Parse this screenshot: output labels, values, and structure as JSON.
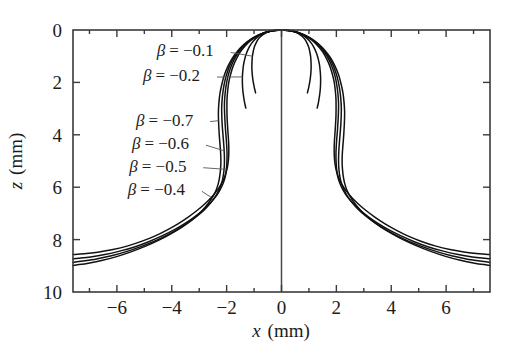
{
  "chart_data": {
    "type": "line",
    "title": "",
    "xlabel": "x (mm)",
    "ylabel": "z (mm)",
    "xlabel_var": "x",
    "xlabel_unit": "(mm)",
    "ylabel_var": "z",
    "ylabel_unit": "(mm)",
    "xlim": [
      -7.6,
      7.6
    ],
    "ylim": [
      0,
      10
    ],
    "y_inverted": true,
    "grid": false,
    "legend_position": "inline-annotations",
    "xticks": [
      -6,
      -4,
      -2,
      0,
      2,
      4,
      6
    ],
    "xtick_labels": [
      "−6",
      "−4",
      "−2",
      "0",
      "2",
      "4",
      "6"
    ],
    "yticks": [
      0,
      2,
      4,
      6,
      8,
      10
    ],
    "ytick_labels": [
      "0",
      "2",
      "4",
      "6",
      "8",
      "10"
    ],
    "xminorticks": [
      -7,
      -5,
      -3,
      -1,
      1,
      3,
      5,
      7
    ],
    "symmetry_axis_x": 0,
    "annotations": [
      {
        "text": "β = −0.1",
        "beta": -0.1,
        "label_x": -4.55,
        "label_z": 0.78
      },
      {
        "text": "β = −0.2",
        "beta": -0.2,
        "label_x": -5.05,
        "label_z": 1.72
      },
      {
        "text": "β = −0.7",
        "beta": -0.7,
        "label_x": -5.3,
        "label_z": 3.42
      },
      {
        "text": "β = −0.6",
        "beta": -0.6,
        "label_x": -5.45,
        "label_z": 4.32
      },
      {
        "text": "β = −0.5",
        "beta": -0.5,
        "label_x": -5.55,
        "label_z": 5.18
      },
      {
        "text": "β = −0.4",
        "beta": -0.4,
        "label_x": -5.6,
        "label_z": 6.08
      }
    ],
    "series": [
      {
        "name": "β = −0.1",
        "beta": -0.1,
        "half_profile": [
          [
            0.0,
            0.0
          ],
          [
            0.12,
            0.005
          ],
          [
            0.26,
            0.02
          ],
          [
            0.4,
            0.05
          ],
          [
            0.54,
            0.1
          ],
          [
            0.66,
            0.17
          ],
          [
            0.77,
            0.26
          ],
          [
            0.86,
            0.37
          ],
          [
            0.93,
            0.5
          ],
          [
            0.99,
            0.65
          ],
          [
            1.03,
            0.82
          ],
          [
            1.06,
            1.0
          ],
          [
            1.075,
            1.19
          ],
          [
            1.08,
            1.38
          ],
          [
            1.075,
            1.57
          ],
          [
            1.06,
            1.75
          ],
          [
            1.04,
            1.92
          ],
          [
            1.015,
            2.07
          ],
          [
            0.99,
            2.2
          ],
          [
            0.965,
            2.31
          ],
          [
            0.945,
            2.4
          ]
        ]
      },
      {
        "name": "β = −0.2",
        "beta": -0.2,
        "half_profile": [
          [
            0.0,
            0.0
          ],
          [
            0.15,
            0.007
          ],
          [
            0.32,
            0.03
          ],
          [
            0.5,
            0.07
          ],
          [
            0.68,
            0.14
          ],
          [
            0.84,
            0.24
          ],
          [
            0.98,
            0.37
          ],
          [
            1.1,
            0.52
          ],
          [
            1.2,
            0.7
          ],
          [
            1.28,
            0.9
          ],
          [
            1.34,
            1.11
          ],
          [
            1.385,
            1.33
          ],
          [
            1.41,
            1.56
          ],
          [
            1.425,
            1.79
          ],
          [
            1.425,
            2.02
          ],
          [
            1.415,
            2.24
          ],
          [
            1.395,
            2.44
          ],
          [
            1.37,
            2.62
          ],
          [
            1.345,
            2.77
          ],
          [
            1.32,
            2.89
          ],
          [
            1.3,
            2.98
          ]
        ]
      },
      {
        "name": "β = −0.4",
        "beta": -0.4,
        "half_profile": [
          [
            0.0,
            0.0
          ],
          [
            0.2,
            0.01
          ],
          [
            0.42,
            0.05
          ],
          [
            0.66,
            0.12
          ],
          [
            0.9,
            0.24
          ],
          [
            1.12,
            0.4
          ],
          [
            1.32,
            0.6
          ],
          [
            1.5,
            0.83
          ],
          [
            1.64,
            1.09
          ],
          [
            1.76,
            1.37
          ],
          [
            1.85,
            1.67
          ],
          [
            1.92,
            1.98
          ],
          [
            1.96,
            2.3
          ],
          [
            1.985,
            2.62
          ],
          [
            1.99,
            2.95
          ],
          [
            1.985,
            3.28
          ],
          [
            1.97,
            3.6
          ],
          [
            1.95,
            3.92
          ],
          [
            1.93,
            4.23
          ],
          [
            1.92,
            4.53
          ],
          [
            1.925,
            4.82
          ],
          [
            1.95,
            5.1
          ],
          [
            2.0,
            5.37
          ],
          [
            2.08,
            5.63
          ],
          [
            2.2,
            5.89
          ],
          [
            2.36,
            6.14
          ],
          [
            2.56,
            6.39
          ],
          [
            2.8,
            6.64
          ],
          [
            3.08,
            6.89
          ],
          [
            3.4,
            7.14
          ],
          [
            3.76,
            7.39
          ],
          [
            4.16,
            7.63
          ],
          [
            4.6,
            7.86
          ],
          [
            5.08,
            8.06
          ],
          [
            5.6,
            8.24
          ],
          [
            6.14,
            8.38
          ],
          [
            6.7,
            8.48
          ],
          [
            7.2,
            8.54
          ],
          [
            7.6,
            8.57
          ]
        ]
      },
      {
        "name": "β = −0.5",
        "beta": -0.5,
        "half_profile": [
          [
            0.0,
            0.0
          ],
          [
            0.21,
            0.012
          ],
          [
            0.44,
            0.05
          ],
          [
            0.7,
            0.13
          ],
          [
            0.96,
            0.26
          ],
          [
            1.2,
            0.43
          ],
          [
            1.42,
            0.65
          ],
          [
            1.6,
            0.9
          ],
          [
            1.75,
            1.18
          ],
          [
            1.87,
            1.48
          ],
          [
            1.96,
            1.8
          ],
          [
            2.02,
            2.13
          ],
          [
            2.06,
            2.47
          ],
          [
            2.08,
            2.81
          ],
          [
            2.075,
            3.15
          ],
          [
            2.06,
            3.49
          ],
          [
            2.04,
            3.82
          ],
          [
            2.015,
            4.14
          ],
          [
            1.995,
            4.45
          ],
          [
            1.985,
            4.75
          ],
          [
            1.99,
            5.04
          ],
          [
            2.01,
            5.32
          ],
          [
            2.05,
            5.59
          ],
          [
            2.13,
            5.86
          ],
          [
            2.25,
            6.12
          ],
          [
            2.41,
            6.38
          ],
          [
            2.62,
            6.63
          ],
          [
            2.88,
            6.89
          ],
          [
            3.18,
            7.14
          ],
          [
            3.53,
            7.39
          ],
          [
            3.92,
            7.63
          ],
          [
            4.36,
            7.86
          ],
          [
            4.84,
            8.08
          ],
          [
            5.36,
            8.28
          ],
          [
            5.9,
            8.44
          ],
          [
            6.44,
            8.57
          ],
          [
            6.96,
            8.66
          ],
          [
            7.4,
            8.71
          ],
          [
            7.6,
            8.73
          ]
        ]
      },
      {
        "name": "β = −0.6",
        "beta": -0.6,
        "half_profile": [
          [
            0.0,
            0.0
          ],
          [
            0.22,
            0.013
          ],
          [
            0.46,
            0.06
          ],
          [
            0.74,
            0.15
          ],
          [
            1.02,
            0.29
          ],
          [
            1.28,
            0.48
          ],
          [
            1.5,
            0.71
          ],
          [
            1.69,
            0.98
          ],
          [
            1.85,
            1.27
          ],
          [
            1.97,
            1.59
          ],
          [
            2.06,
            1.92
          ],
          [
            2.12,
            2.26
          ],
          [
            2.16,
            2.61
          ],
          [
            2.18,
            2.96
          ],
          [
            2.175,
            3.31
          ],
          [
            2.16,
            3.65
          ],
          [
            2.135,
            3.98
          ],
          [
            2.11,
            4.3
          ],
          [
            2.09,
            4.61
          ],
          [
            2.08,
            4.91
          ],
          [
            2.085,
            5.2
          ],
          [
            2.11,
            5.48
          ],
          [
            2.16,
            5.76
          ],
          [
            2.25,
            6.03
          ],
          [
            2.38,
            6.3
          ],
          [
            2.56,
            6.57
          ],
          [
            2.78,
            6.83
          ],
          [
            3.06,
            7.09
          ],
          [
            3.38,
            7.34
          ],
          [
            3.75,
            7.59
          ],
          [
            4.17,
            7.83
          ],
          [
            4.63,
            8.06
          ],
          [
            5.13,
            8.27
          ],
          [
            5.66,
            8.46
          ],
          [
            6.2,
            8.62
          ],
          [
            6.74,
            8.74
          ],
          [
            7.24,
            8.82
          ],
          [
            7.6,
            8.87
          ]
        ]
      },
      {
        "name": "β = −0.7",
        "beta": -0.7,
        "half_profile": [
          [
            0.0,
            0.0
          ],
          [
            0.23,
            0.015
          ],
          [
            0.49,
            0.07
          ],
          [
            0.78,
            0.17
          ],
          [
            1.08,
            0.33
          ],
          [
            1.35,
            0.54
          ],
          [
            1.59,
            0.79
          ],
          [
            1.79,
            1.07
          ],
          [
            1.95,
            1.38
          ],
          [
            2.08,
            1.71
          ],
          [
            2.17,
            2.05
          ],
          [
            2.24,
            2.4
          ],
          [
            2.28,
            2.76
          ],
          [
            2.3,
            3.11
          ],
          [
            2.295,
            3.46
          ],
          [
            2.28,
            3.8
          ],
          [
            2.26,
            4.13
          ],
          [
            2.235,
            4.45
          ],
          [
            2.215,
            4.76
          ],
          [
            2.21,
            5.06
          ],
          [
            2.225,
            5.35
          ],
          [
            2.26,
            5.64
          ],
          [
            2.32,
            5.92
          ],
          [
            2.42,
            6.2
          ],
          [
            2.57,
            6.47
          ],
          [
            2.76,
            6.74
          ],
          [
            3.0,
            7.01
          ],
          [
            3.29,
            7.27
          ],
          [
            3.63,
            7.52
          ],
          [
            4.02,
            7.77
          ],
          [
            4.45,
            8.01
          ],
          [
            4.93,
            8.24
          ],
          [
            5.44,
            8.45
          ],
          [
            5.98,
            8.64
          ],
          [
            6.52,
            8.79
          ],
          [
            7.04,
            8.9
          ],
          [
            7.48,
            8.97
          ],
          [
            7.6,
            8.99
          ]
        ]
      }
    ]
  },
  "axes": {
    "frame_color": "#3a3a3a",
    "curve_color": "#111111",
    "background": "#ffffff"
  }
}
